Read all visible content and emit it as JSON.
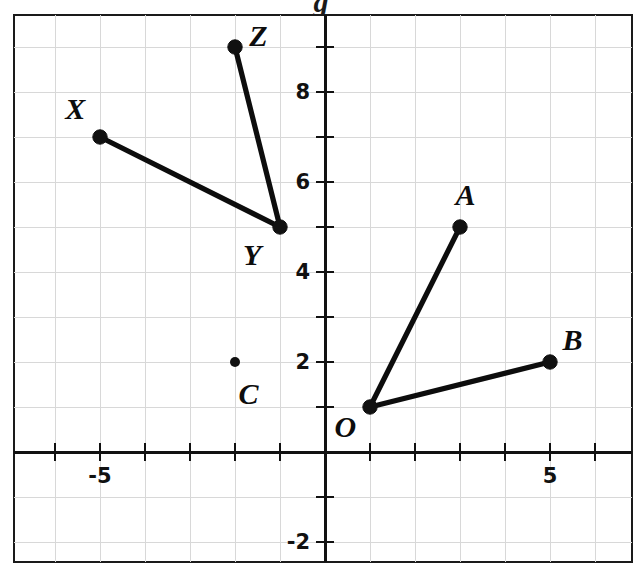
{
  "figure": {
    "title": "",
    "background_color": "#ffffff",
    "ink_color": "#111111",
    "grid_color": "#d8d8d8"
  },
  "chart_data": {
    "type": "scatter",
    "title": "",
    "xlabel": "",
    "ylabel": "",
    "xlim": [
      -6.9,
      6.8
    ],
    "ylim": [
      -2.7,
      9.7
    ],
    "xticks": [
      -6,
      -5,
      -4,
      -3,
      -2,
      -1,
      1,
      2,
      3,
      4,
      5,
      6
    ],
    "yticks": [
      -2,
      -1,
      1,
      2,
      3,
      4,
      5,
      6,
      7,
      8,
      9
    ],
    "xtick_labels": [
      {
        "value": -5,
        "text": "-5"
      },
      {
        "value": 5,
        "text": "5"
      }
    ],
    "ytick_labels": [
      {
        "value": -2,
        "text": "-2"
      },
      {
        "value": 2,
        "text": "2"
      },
      {
        "value": 4,
        "text": "4"
      },
      {
        "value": 6,
        "text": "6"
      },
      {
        "value": 8,
        "text": "8"
      }
    ],
    "grid": true,
    "grid_spacing": 1,
    "legend": "none",
    "points": [
      {
        "label": "X",
        "x": -5,
        "y": 7,
        "label_dx": -0.55,
        "label_dy": 0.62,
        "size": "large"
      },
      {
        "label": "Y",
        "x": -1,
        "y": 5,
        "label_dx": -0.62,
        "label_dy": -0.62,
        "size": "large"
      },
      {
        "label": "Z",
        "x": -2,
        "y": 9,
        "label_dx": 0.52,
        "label_dy": 0.25,
        "size": "large"
      },
      {
        "label": "C",
        "x": -2,
        "y": 2,
        "label_dx": 0.3,
        "label_dy": -0.72,
        "size": "small"
      },
      {
        "label": "O",
        "x": 1,
        "y": 1,
        "label_dx": -0.55,
        "label_dy": -0.45,
        "size": "large"
      },
      {
        "label": "A",
        "x": 3,
        "y": 5,
        "label_dx": 0.12,
        "label_dy": 0.72,
        "size": "large"
      },
      {
        "label": "B",
        "x": 5,
        "y": 2,
        "label_dx": 0.5,
        "label_dy": 0.48,
        "size": "large"
      }
    ],
    "segments": [
      {
        "name": "XY",
        "from": "X",
        "to": "Y"
      },
      {
        "name": "ZY",
        "from": "Z",
        "to": "Y"
      },
      {
        "name": "OA",
        "from": "O",
        "to": "A"
      },
      {
        "name": "OB",
        "from": "O",
        "to": "B"
      }
    ],
    "top_fragment_text": "g"
  },
  "geometry": {
    "frame_left": 14,
    "frame_top": 15,
    "frame_right": 632,
    "frame_bottom": 562,
    "origin_x": 325,
    "origin_y": 452,
    "unit_px": 45
  }
}
